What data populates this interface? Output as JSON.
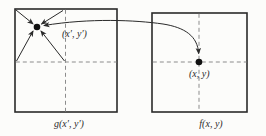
{
  "figure": {
    "type": "geometric-transformation-diagram",
    "left_square": {
      "point_label": "(x′, y′)",
      "caption": "g(x′, y′)"
    },
    "right_square": {
      "point_label": "(x, y)",
      "caption": "f(x, y)"
    },
    "colors": {
      "background": "#fcfcfa",
      "line": "#2a2a2a",
      "dashed": "#8c8c8c",
      "dot": "#111111",
      "text": "#2b2b2b"
    }
  }
}
